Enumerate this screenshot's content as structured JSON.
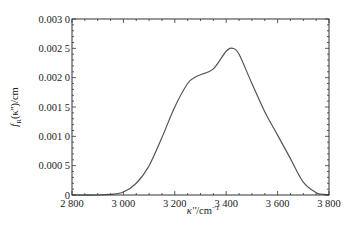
{
  "chart_data": {
    "type": "line",
    "title": "",
    "xlabel": "κ''/cm⁻¹",
    "ylabel": "f_R(κ'')/cm",
    "xlim": [
      2800,
      3800
    ],
    "ylim": [
      0,
      0.003
    ],
    "grid": false,
    "legend": null,
    "x_ticks": [
      "2 800",
      "3 000",
      "3 200",
      "3 400",
      "3 600",
      "3 800"
    ],
    "y_ticks": [
      "0",
      "0.000 5",
      "0.001 0",
      "0.001 5",
      "0.002 0",
      "0.002 5",
      "0.003 0"
    ],
    "series": [
      {
        "name": "f_R(κ'')",
        "color": "#555555",
        "x": [
          2800,
          2900,
          2950,
          3000,
          3050,
          3100,
          3150,
          3200,
          3250,
          3280,
          3300,
          3350,
          3400,
          3425,
          3450,
          3500,
          3550,
          3600,
          3650,
          3700,
          3750,
          3780,
          3800
        ],
        "y": [
          0,
          0,
          1e-05,
          5e-05,
          0.0002,
          0.0005,
          0.00098,
          0.0015,
          0.0019,
          0.00201,
          0.00205,
          0.00215,
          0.00245,
          0.0025,
          0.0024,
          0.0019,
          0.00142,
          0.00102,
          0.00062,
          0.00022,
          4e-05,
          1e-05,
          0
        ]
      }
    ]
  },
  "axes": {
    "xlabel_main": "κ''",
    "xlabel_unit": "/cm",
    "xlabel_sup": "−1",
    "ylabel_f": "f",
    "ylabel_sub": "R",
    "ylabel_rest": "(κ'')/cm"
  }
}
